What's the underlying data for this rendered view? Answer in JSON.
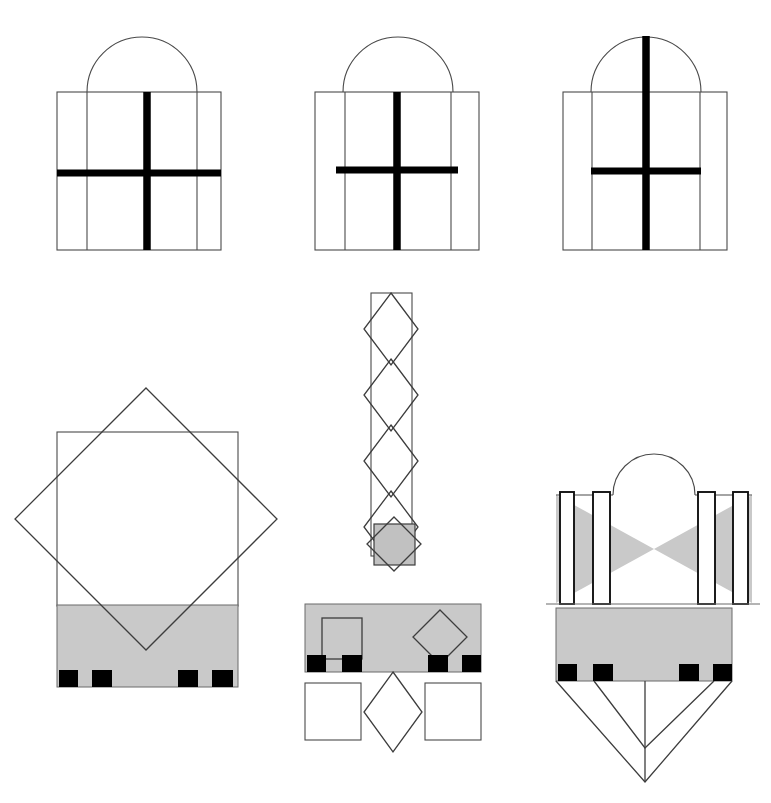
{
  "plate": {
    "title": "Geometric Architectural Analysis Plate",
    "width": 771,
    "height": 803,
    "background": "#ffffff",
    "caption": ""
  },
  "palette": {
    "ink": "#000000",
    "thin_line": "#4a4a4a",
    "gray_fill": "#c9c9c9",
    "gray_fill_alt": "#c1c1c1",
    "white": "#ffffff",
    "rule": "#6b6b6b"
  },
  "figures": [
    {
      "id": "fig-top-left",
      "name": "arched-facade-wide-cross",
      "label": "Top left: arched bay with full-width cross",
      "description": "Square elevation with two inset vertical mullions, a semicircular arch springing from the top edge, and a heavy cross whose horizontal arm runs the full width of the square.",
      "square": {
        "x": 57,
        "y": 92,
        "w": 164,
        "h": 158
      },
      "inner_verticals_x": [
        87,
        197
      ],
      "arch": {
        "cx": 142,
        "cy": 92,
        "r": 55,
        "type": "semicircle"
      },
      "cross": {
        "vertical": {
          "x": 147,
          "y1": 92,
          "y2": 250
        },
        "horizontal": {
          "y": 173,
          "x1": 57,
          "x2": 221
        }
      }
    },
    {
      "id": "fig-top-middle",
      "name": "arched-facade-inset-cross",
      "label": "Top middle: arched bay with inset cross arm",
      "description": "Same square elevation and arch, but the heavy horizontal arm is shortened to span only between the inner mullions.",
      "square": {
        "x": 315,
        "y": 92,
        "w": 164,
        "h": 158
      },
      "inner_verticals_x": [
        345,
        451
      ],
      "arch": {
        "cx": 398,
        "cy": 92,
        "r": 55,
        "type": "semicircle"
      },
      "cross": {
        "vertical": {
          "x": 397,
          "y1": 92,
          "y2": 250
        },
        "horizontal": {
          "y": 170,
          "x1": 336,
          "x2": 458
        }
      }
    },
    {
      "id": "fig-top-right",
      "name": "arched-facade-full-height-mullion",
      "label": "Top right: arched bay with mullion rising through arch",
      "description": "Square elevation and arch where the heavy vertical rises from the base all the way to the crown of the arch; the horizontal arm is inset.",
      "square": {
        "x": 563,
        "y": 92,
        "w": 164,
        "h": 158
      },
      "inner_verticals_x": [
        592,
        700
      ],
      "arch": {
        "cx": 646,
        "cy": 92,
        "r": 55,
        "type": "semicircle"
      },
      "cross": {
        "vertical": {
          "x": 646,
          "y1": 36,
          "y2": 250
        },
        "horizontal": {
          "y": 171,
          "x1": 591,
          "x2": 701
        }
      }
    },
    {
      "id": "fig-center-column",
      "name": "diamond-chain-column",
      "label": "Center: narrow shaft with chain of four diamonds",
      "description": "Tall narrow rectangle containing four overlapping rotated squares stacked vertically, their side vertices projecting slightly past the shaft.",
      "shaft": {
        "x": 371,
        "y": 293,
        "w": 41,
        "h": 263
      },
      "diamond_count": 4,
      "diamond": {
        "cx": 391,
        "half_w": 27,
        "half_h": 36
      },
      "diamond_centers_y": [
        329,
        395,
        461,
        527
      ]
    },
    {
      "id": "fig-center-star",
      "name": "square-and-diamond-star",
      "label": "Center: gray square overlaid by rotated square",
      "description": "Small gray-filled square with a rotated square of the same size laid over it, producing an eight-pointed star outline.",
      "square": {
        "x": 374,
        "y": 524,
        "w": 41,
        "h": 41
      },
      "diamond": {
        "cx": 394,
        "cy": 544,
        "half": 27
      },
      "fill": "#c1c1c1"
    },
    {
      "id": "fig-bottom-left",
      "name": "square-rotated-square-plinth",
      "label": "Bottom left: square with inscribed rotated square over stepped plinth",
      "description": "Large square outline crossed by a larger rotated square whose lower vertex reaches the base line; a gray plinth band below carries four black blocks.",
      "square": {
        "x": 57,
        "y": 432,
        "w": 181,
        "h": 174
      },
      "diamond": {
        "cx": 146,
        "cy": 519,
        "half_w": 131,
        "half_h": 131
      },
      "band": {
        "x": 57,
        "y": 605,
        "w": 181,
        "h": 82
      },
      "blocks": [
        {
          "x": 59,
          "y": 670,
          "w": 19,
          "h": 17
        },
        {
          "x": 92,
          "y": 670,
          "w": 20,
          "h": 17
        },
        {
          "x": 178,
          "y": 670,
          "w": 20,
          "h": 17
        },
        {
          "x": 212,
          "y": 670,
          "w": 21,
          "h": 17
        }
      ]
    },
    {
      "id": "fig-bottom-middle",
      "name": "plinth-with-square-and-diamond-modules",
      "label": "Bottom middle: gray plinth with square and diamond motifs",
      "description": "Gray rectangle inscribed with a square outline at left and a diamond outline at right, four black blocks along the lower edge, and beneath it two white squares flanking a white diamond.",
      "band": {
        "x": 305,
        "y": 604,
        "w": 176,
        "h": 68
      },
      "inner_square": {
        "x": 322,
        "y": 618,
        "w": 40,
        "h": 41
      },
      "inner_diamond": {
        "cx": 440,
        "cy": 637,
        "half": 27
      },
      "blocks": [
        {
          "x": 307,
          "y": 655,
          "w": 19,
          "h": 17
        },
        {
          "x": 342,
          "y": 655,
          "w": 20,
          "h": 17
        },
        {
          "x": 428,
          "y": 655,
          "w": 20,
          "h": 17
        },
        {
          "x": 462,
          "y": 655,
          "w": 19,
          "h": 17
        }
      ],
      "lower_square_left": {
        "x": 305,
        "y": 683,
        "w": 56,
        "h": 57
      },
      "lower_square_right": {
        "x": 425,
        "y": 683,
        "w": 56,
        "h": 57
      },
      "lower_diamond": {
        "cx": 393,
        "cy": 712,
        "half": 29
      }
    },
    {
      "id": "fig-bottom-right",
      "name": "bowtie-colonnade-with-cone",
      "label": "Bottom right: arched colonnade with bowtie shading and projected cone",
      "description": "An arch over a bowtie of two gray triangles meeting at the centre, four white piers standing in front, a ground rule, a gray plinth with four black blocks, and a nested V-shaped cone of sight lines projected below.",
      "arch": {
        "cx": 654,
        "cy": 495,
        "r": 41,
        "type": "semicircle"
      },
      "bowtie": {
        "left_triangle": [
          [
            556,
            495
          ],
          [
            556,
            603
          ],
          [
            654,
            549
          ]
        ],
        "right_triangle": [
          [
            752,
            495
          ],
          [
            752,
            603
          ],
          [
            654,
            549
          ]
        ]
      },
      "piers": [
        {
          "x": 560,
          "y": 492,
          "w": 14,
          "h": 112
        },
        {
          "x": 593,
          "y": 492,
          "w": 17,
          "h": 112
        },
        {
          "x": 698,
          "y": 492,
          "w": 17,
          "h": 112
        },
        {
          "x": 733,
          "y": 492,
          "w": 15,
          "h": 112
        }
      ],
      "ground_rule": {
        "x1": 546,
        "y": 604,
        "x2": 760
      },
      "band": {
        "x": 556,
        "y": 608,
        "w": 176,
        "h": 73
      },
      "blocks": [
        {
          "x": 558,
          "y": 664,
          "w": 19,
          "h": 17
        },
        {
          "x": 593,
          "y": 664,
          "w": 20,
          "h": 17
        },
        {
          "x": 679,
          "y": 664,
          "w": 20,
          "h": 17
        },
        {
          "x": 713,
          "y": 664,
          "w": 19,
          "h": 17
        }
      ],
      "cone": {
        "apex_outer": [
          645,
          782
        ],
        "apex_inner": [
          645,
          748
        ],
        "outer_left": [
          556,
          681
        ],
        "outer_right": [
          732,
          681
        ],
        "inner_left": [
          594,
          681
        ],
        "inner_right": [
          714,
          681
        ],
        "center_line": {
          "x": 645,
          "y1": 681,
          "y2": 782
        }
      }
    }
  ]
}
